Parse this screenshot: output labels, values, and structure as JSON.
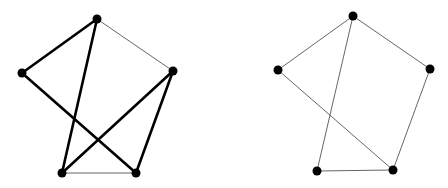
{
  "graphs": [
    {
      "name": "graph-left",
      "nodes": [
        {
          "id": "top",
          "x": 97,
          "y": 19
        },
        {
          "id": "left",
          "x": 22,
          "y": 73
        },
        {
          "id": "right",
          "x": 173,
          "y": 71
        },
        {
          "id": "bottom-left",
          "x": 62,
          "y": 173
        },
        {
          "id": "bottom-right",
          "x": 136,
          "y": 173
        }
      ],
      "edges": [
        {
          "from": "top",
          "to": "left",
          "weight": "thick"
        },
        {
          "from": "top",
          "to": "bottom-left",
          "weight": "thick"
        },
        {
          "from": "left",
          "to": "bottom-right",
          "weight": "thick"
        },
        {
          "from": "right",
          "to": "bottom-left",
          "weight": "thick"
        },
        {
          "from": "right",
          "to": "bottom-right",
          "weight": "thick"
        },
        {
          "from": "top",
          "to": "right",
          "weight": "thin"
        },
        {
          "from": "bottom-left",
          "to": "bottom-right",
          "weight": "thin"
        }
      ]
    },
    {
      "name": "graph-right",
      "nodes": [
        {
          "id": "top",
          "x": 353,
          "y": 16
        },
        {
          "id": "left",
          "x": 278,
          "y": 70
        },
        {
          "id": "right",
          "x": 430,
          "y": 69
        },
        {
          "id": "bottom-left",
          "x": 317,
          "y": 171
        },
        {
          "id": "bottom-right",
          "x": 393,
          "y": 170
        }
      ],
      "edges": [
        {
          "from": "top",
          "to": "left",
          "weight": "thin"
        },
        {
          "from": "top",
          "to": "right",
          "weight": "thin"
        },
        {
          "from": "top",
          "to": "bottom-left",
          "weight": "thin"
        },
        {
          "from": "left",
          "to": "bottom-right",
          "weight": "thin"
        },
        {
          "from": "right",
          "to": "bottom-right",
          "weight": "thin"
        },
        {
          "from": "bottom-left",
          "to": "bottom-right",
          "weight": "thin"
        }
      ]
    }
  ],
  "style": {
    "node_color": "#000000",
    "node_radius": 4.5,
    "thick_width": 2.6,
    "thin_width": 0.9,
    "thick_color": "#000000",
    "thin_color": "#555555"
  }
}
